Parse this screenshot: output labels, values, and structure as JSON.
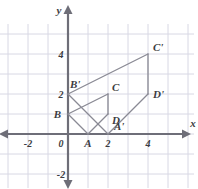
{
  "figure": {
    "axis_labels": {
      "x": "x",
      "y": "y"
    },
    "x_ticks": [
      {
        "value": -2,
        "label": "-2"
      },
      {
        "value": 0,
        "label": "0"
      },
      {
        "value": 2,
        "label": "2"
      },
      {
        "value": 4,
        "label": "4"
      }
    ],
    "y_ticks": [
      {
        "value": 4,
        "label": "4"
      },
      {
        "value": 2,
        "label": "2"
      },
      {
        "value": -2,
        "label": "-2"
      }
    ],
    "origin_label": "0",
    "colors": {
      "grid": "#d8d8e4",
      "axis": "#6e6e78",
      "shape": "#8a8a94",
      "text": "#3c3c42",
      "background": "#ffffff"
    },
    "points": [
      {
        "name": "A",
        "label": "A",
        "x": 1,
        "y": 0
      },
      {
        "name": "B",
        "label": "B",
        "x": 0,
        "y": 1
      },
      {
        "name": "C",
        "label": "C",
        "x": 2,
        "y": 2
      },
      {
        "name": "D",
        "label": "D",
        "x": 2,
        "y": 1
      },
      {
        "name": "A'",
        "label": "A'",
        "x": 2,
        "y": 0
      },
      {
        "name": "B'",
        "label": "B'",
        "x": 0,
        "y": 2
      },
      {
        "name": "C'",
        "label": "C'",
        "x": 4,
        "y": 4
      },
      {
        "name": "D'",
        "label": "D'",
        "x": 4,
        "y": 2
      }
    ],
    "preimage_vertices": [
      "A",
      "B",
      "C",
      "D"
    ],
    "image_vertices": [
      "A'",
      "B'",
      "C'",
      "D'"
    ],
    "edges": [
      {
        "from": "B",
        "to": "A"
      },
      {
        "from": "A",
        "to": "D"
      },
      {
        "from": "D",
        "to": "C"
      },
      {
        "from": "C",
        "to": "B"
      },
      {
        "from": "B'",
        "to": "A'"
      },
      {
        "from": "A'",
        "to": "D'"
      },
      {
        "from": "D'",
        "to": "C'"
      },
      {
        "from": "C'",
        "to": "B'"
      }
    ],
    "view": {
      "x_min": -3.4,
      "x_max": 6.3,
      "y_min": -2.7,
      "y_max": 5.5,
      "unit_px": 20,
      "origin_px": {
        "x": 68,
        "y": 134
      },
      "grid_on": true
    }
  }
}
